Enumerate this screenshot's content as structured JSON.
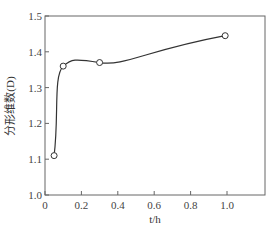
{
  "chart_data": {
    "type": "line",
    "title": "",
    "xlabel": "t/h",
    "ylabel": "分形维数(D)",
    "xlim": [
      0,
      1.2
    ],
    "ylim": [
      1.0,
      1.5
    ],
    "xticks": [
      "0",
      "0.2",
      "0.4",
      "0.6",
      "0.8",
      "1.0"
    ],
    "yticks": [
      "1.0",
      "1.1",
      "1.2",
      "1.3",
      "1.4",
      "1.5"
    ],
    "grid": false,
    "legend": null,
    "series": [
      {
        "name": "分形维数",
        "marker": "open-circle",
        "smooth": true,
        "x": [
          0.05,
          0.1,
          0.3,
          0.99
        ],
        "y": [
          1.11,
          1.36,
          1.37,
          1.445
        ]
      }
    ]
  }
}
